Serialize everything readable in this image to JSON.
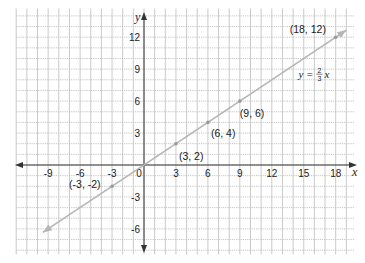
{
  "chart_data": {
    "type": "line",
    "title": "",
    "xlabel": "x",
    "ylabel": "y",
    "equation": {
      "lhs": "y =",
      "num": "2",
      "den": "3",
      "var": "x",
      "at": [
        14.5,
        8.2
      ]
    },
    "xlim": [
      -12,
      19.8
    ],
    "ylim": [
      -8.4,
      14.7
    ],
    "grid": true,
    "x_ticks": [
      -9,
      -6,
      -3,
      0,
      3,
      6,
      9,
      12,
      15,
      18
    ],
    "y_ticks": [
      12,
      9,
      6,
      3,
      -3,
      -6
    ],
    "series": [
      {
        "name": "y = 2/3 x",
        "slope": 0.6667,
        "intercept": 0,
        "x_range": [
          -9.5,
          19
        ],
        "color": "#b5b5b5",
        "points": [
          {
            "x": -3,
            "y": -2,
            "label": "(-3, -2)"
          },
          {
            "x": 3,
            "y": 2,
            "label": "(3, 2)"
          },
          {
            "x": 6,
            "y": 4,
            "label": "(6, 4)"
          },
          {
            "x": 9,
            "y": 6,
            "label": "(9, 6)"
          },
          {
            "x": 18,
            "y": 12,
            "label": "(18, 12)"
          }
        ]
      }
    ],
    "layout": {
      "origin_px": [
        144,
        165
      ],
      "unit_px": 10.65,
      "grid_color": "#bdbdbd",
      "axis_color": "#333333"
    }
  }
}
